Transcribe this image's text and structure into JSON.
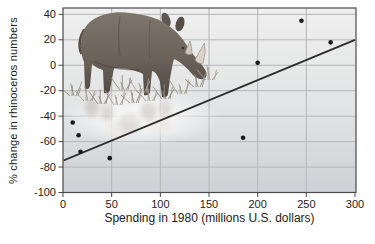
{
  "chart_data": {
    "type": "scatter",
    "title": "",
    "xlabel": "Spending in 1980 (millions U.S. dollars)",
    "ylabel": "% change in rhinoceros numbers",
    "xlim": [
      0,
      300
    ],
    "ylim": [
      -100,
      45
    ],
    "x_ticks": [
      0,
      50,
      100,
      150,
      200,
      250,
      300
    ],
    "y_ticks": [
      40,
      20,
      0,
      -20,
      -40,
      -60,
      -80,
      -100
    ],
    "grid": true,
    "legend": "none",
    "points": [
      {
        "x": 10,
        "y": -45
      },
      {
        "x": 16,
        "y": -55
      },
      {
        "x": 18,
        "y": -68
      },
      {
        "x": 48,
        "y": -73
      },
      {
        "x": 185,
        "y": -57
      },
      {
        "x": 200,
        "y": 2
      },
      {
        "x": 245,
        "y": 35
      },
      {
        "x": 275,
        "y": 18
      }
    ],
    "trendline": {
      "x1": 0,
      "y1": -75,
      "x2": 300,
      "y2": 20
    },
    "illustration": "rhinoceros walking in grass with faded reflection",
    "colors": {
      "point": "#1a1a1a",
      "trend": "#2b2b2b",
      "grid": "#b5b5b5",
      "frame": "#4a4a4a",
      "plot_bg_top": "#ededed",
      "plot_bg_bottom": "#cdd1d5",
      "text": "#1c1c1c"
    }
  }
}
